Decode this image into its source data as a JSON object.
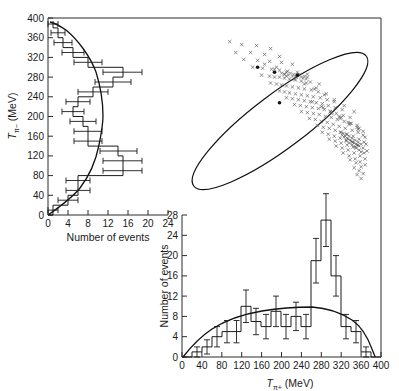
{
  "figure": {
    "caption": "",
    "background": "#ffffff",
    "ink_color": "#1a1a1a"
  },
  "panels": {
    "left_histogram": {
      "name": "T-pi-minus histogram",
      "value_axis_label": "Number of events",
      "energy_axis_label": "Tπ− (MeV)",
      "energy_axis_label_main": "T",
      "energy_axis_label_sub": "π−",
      "energy_axis_label_unit": "(MeV)",
      "value_axis_ticks": [
        0,
        4,
        8,
        12,
        16,
        20,
        24
      ],
      "energy_axis_ticks": [
        0,
        40,
        80,
        120,
        160,
        200,
        240,
        280,
        320,
        360,
        400
      ]
    },
    "bottom_histogram": {
      "name": "T-pi-plus histogram",
      "value_axis_label": "Number of events",
      "energy_axis_label": "Tπ+ (MeV)",
      "energy_axis_label_main": "T",
      "energy_axis_label_sub": "π+",
      "energy_axis_label_unit": "(MeV)",
      "value_axis_ticks": [
        0,
        4,
        8,
        12,
        16,
        20,
        24,
        28
      ],
      "energy_axis_ticks": [
        0,
        40,
        80,
        120,
        160,
        200,
        240,
        280,
        320,
        360,
        400
      ]
    },
    "scatter": {
      "name": "Dalitz scatter plot",
      "boundary_shape": "ellipse",
      "marker": "cross"
    }
  },
  "chart_data": [
    {
      "type": "bar",
      "orientation": "horizontal",
      "title": "",
      "xlabel": "Number of events",
      "ylabel": "Tπ− (MeV)",
      "xlim": [
        0,
        24
      ],
      "ylim": [
        0,
        400
      ],
      "bin_width": 20,
      "grid": false,
      "bin_centers": [
        10,
        30,
        50,
        70,
        90,
        110,
        130,
        150,
        170,
        190,
        210,
        230,
        250,
        270,
        290,
        310,
        330,
        350,
        370,
        390
      ],
      "values": [
        1,
        4,
        6,
        6,
        15,
        15,
        14,
        8,
        8,
        7,
        5,
        6,
        9,
        13,
        15,
        8,
        5,
        3,
        2,
        1
      ],
      "errors": [
        1,
        2,
        2.4,
        2.4,
        3.9,
        3.9,
        3.7,
        2.8,
        2.8,
        2.6,
        2.2,
        2.4,
        3,
        3.6,
        3.9,
        2.8,
        2.2,
        1.7,
        1.4,
        1
      ],
      "overlay_curve": {
        "name": "phase-space prediction",
        "peak_value": 10,
        "x_at_peak": 200,
        "endpoints": [
          0,
          380
        ]
      }
    },
    {
      "type": "bar",
      "orientation": "vertical",
      "title": "",
      "xlabel": "Tπ+ (MeV)",
      "ylabel": "Number of events",
      "xlim": [
        0,
        400
      ],
      "ylim": [
        0,
        28
      ],
      "bin_width": 20,
      "grid": false,
      "bin_centers": [
        10,
        30,
        50,
        70,
        90,
        110,
        130,
        150,
        170,
        190,
        210,
        230,
        250,
        270,
        290,
        310,
        330,
        350,
        370,
        390
      ],
      "values": [
        0,
        1,
        2,
        4,
        5,
        5,
        10,
        7,
        6,
        9,
        6,
        8,
        6,
        19,
        27,
        16,
        6,
        5,
        1,
        0
      ],
      "errors": [
        0,
        1,
        1.4,
        2,
        2.2,
        2.2,
        3.2,
        2.6,
        2.4,
        3,
        2.4,
        2.8,
        2.4,
        4.4,
        5.2,
        4,
        2.4,
        2.2,
        1,
        0
      ],
      "overlay_curve": {
        "name": "phase-space prediction",
        "peak_value": 10,
        "x_at_peak": 200,
        "endpoints": [
          0,
          380
        ]
      }
    },
    {
      "type": "scatter",
      "title": "",
      "xlabel": "Tπ+ (MeV)",
      "ylabel": "Tπ− (MeV)",
      "xlim": [
        0,
        400
      ],
      "ylim": [
        0,
        400
      ],
      "grid": false,
      "marker": "x",
      "boundary": {
        "type": "ellipse",
        "center_x": 200,
        "center_y": 200,
        "semi_major": 250,
        "semi_minor": 42,
        "rotation_deg": -45
      },
      "n_points": 168,
      "points": [
        [
          96,
          352
        ],
        [
          120,
          346
        ],
        [
          150,
          344
        ],
        [
          178,
          338
        ],
        [
          108,
          330
        ],
        [
          138,
          330
        ],
        [
          166,
          326
        ],
        [
          196,
          322
        ],
        [
          124,
          316
        ],
        [
          152,
          314
        ],
        [
          176,
          312
        ],
        [
          200,
          310
        ],
        [
          222,
          306
        ],
        [
          142,
          300
        ],
        [
          162,
          298
        ],
        [
          180,
          296
        ],
        [
          196,
          294
        ],
        [
          212,
          292
        ],
        [
          232,
          290
        ],
        [
          252,
          286
        ],
        [
          160,
          284
        ],
        [
          176,
          282
        ],
        [
          186,
          280
        ],
        [
          196,
          280
        ],
        [
          206,
          278
        ],
        [
          216,
          276
        ],
        [
          228,
          274
        ],
        [
          240,
          272
        ],
        [
          258,
          270
        ],
        [
          276,
          266
        ],
        [
          178,
          268
        ],
        [
          190,
          266
        ],
        [
          200,
          264
        ],
        [
          210,
          262
        ],
        [
          222,
          260
        ],
        [
          234,
          258
        ],
        [
          246,
          256
        ],
        [
          260,
          254
        ],
        [
          274,
          250
        ],
        [
          290,
          246
        ],
        [
          196,
          252
        ],
        [
          206,
          250
        ],
        [
          216,
          248
        ],
        [
          228,
          246
        ],
        [
          240,
          244
        ],
        [
          252,
          242
        ],
        [
          264,
          240
        ],
        [
          278,
          238
        ],
        [
          292,
          234
        ],
        [
          306,
          230
        ],
        [
          210,
          238
        ],
        [
          222,
          236
        ],
        [
          234,
          234
        ],
        [
          246,
          232
        ],
        [
          258,
          230
        ],
        [
          270,
          228
        ],
        [
          282,
          226
        ],
        [
          294,
          222
        ],
        [
          308,
          218
        ],
        [
          322,
          214
        ],
        [
          226,
          224
        ],
        [
          238,
          222
        ],
        [
          250,
          220
        ],
        [
          262,
          218
        ],
        [
          274,
          216
        ],
        [
          286,
          214
        ],
        [
          298,
          210
        ],
        [
          310,
          206
        ],
        [
          324,
          202
        ],
        [
          338,
          198
        ],
        [
          240,
          210
        ],
        [
          252,
          208
        ],
        [
          264,
          206
        ],
        [
          276,
          204
        ],
        [
          288,
          200
        ],
        [
          300,
          198
        ],
        [
          312,
          194
        ],
        [
          326,
          190
        ],
        [
          340,
          186
        ],
        [
          352,
          182
        ],
        [
          256,
          196
        ],
        [
          268,
          194
        ],
        [
          280,
          190
        ],
        [
          292,
          188
        ],
        [
          304,
          184
        ],
        [
          316,
          180
        ],
        [
          328,
          176
        ],
        [
          342,
          172
        ],
        [
          354,
          168
        ],
        [
          364,
          162
        ],
        [
          272,
          182
        ],
        [
          284,
          178
        ],
        [
          296,
          176
        ],
        [
          308,
          172
        ],
        [
          320,
          168
        ],
        [
          332,
          164
        ],
        [
          344,
          160
        ],
        [
          356,
          154
        ],
        [
          366,
          148
        ],
        [
          282,
          168
        ],
        [
          294,
          164
        ],
        [
          306,
          160
        ],
        [
          318,
          156
        ],
        [
          330,
          152
        ],
        [
          342,
          148
        ],
        [
          354,
          142
        ],
        [
          364,
          136
        ],
        [
          296,
          154
        ],
        [
          308,
          150
        ],
        [
          320,
          146
        ],
        [
          332,
          142
        ],
        [
          344,
          138
        ],
        [
          356,
          132
        ],
        [
          366,
          126
        ],
        [
          310,
          140
        ],
        [
          322,
          136
        ],
        [
          334,
          132
        ],
        [
          346,
          126
        ],
        [
          358,
          120
        ],
        [
          368,
          114
        ],
        [
          324,
          126
        ],
        [
          336,
          120
        ],
        [
          348,
          114
        ],
        [
          358,
          108
        ],
        [
          368,
          102
        ],
        [
          338,
          112
        ],
        [
          350,
          106
        ],
        [
          360,
          98
        ],
        [
          346,
          96
        ],
        [
          356,
          90
        ],
        [
          364,
          84
        ],
        [
          352,
          82
        ],
        [
          360,
          74
        ],
        [
          190,
          300
        ],
        [
          210,
          290
        ],
        [
          230,
          280
        ],
        [
          250,
          268
        ],
        [
          270,
          258
        ],
        [
          166,
          306
        ],
        [
          186,
          296
        ],
        [
          206,
          286
        ],
        [
          226,
          276
        ],
        [
          246,
          266
        ],
        [
          266,
          256
        ],
        [
          286,
          244
        ],
        [
          306,
          234
        ],
        [
          326,
          222
        ],
        [
          346,
          210
        ],
        [
          300,
          206
        ],
        [
          318,
          196
        ],
        [
          336,
          184
        ],
        [
          354,
          174
        ],
        [
          284,
          218
        ],
        [
          302,
          208
        ],
        [
          320,
          198
        ],
        [
          338,
          186
        ],
        [
          356,
          176
        ],
        [
          262,
          230
        ],
        [
          280,
          220
        ],
        [
          298,
          210
        ],
        [
          316,
          200
        ],
        [
          334,
          188
        ],
        [
          352,
          178
        ],
        [
          364,
          170
        ],
        [
          368,
          158
        ],
        [
          370,
          144
        ],
        [
          372,
          130
        ],
        [
          360,
          128
        ],
        [
          350,
          136
        ]
      ],
      "dense_points": [
        [
          218,
          288
        ],
        [
          224,
          286
        ],
        [
          230,
          284
        ],
        [
          236,
          286
        ],
        [
          222,
          282
        ],
        [
          228,
          280
        ],
        [
          234,
          282
        ],
        [
          240,
          280
        ],
        [
          214,
          284
        ],
        [
          210,
          282
        ],
        [
          206,
          286
        ],
        [
          200,
          288
        ],
        [
          244,
          278
        ],
        [
          250,
          276
        ],
        [
          246,
          282
        ],
        [
          252,
          280
        ],
        [
          330,
          150
        ],
        [
          336,
          146
        ],
        [
          342,
          142
        ],
        [
          348,
          138
        ],
        [
          334,
          154
        ],
        [
          340,
          150
        ],
        [
          346,
          146
        ],
        [
          352,
          142
        ],
        [
          326,
          158
        ],
        [
          332,
          156
        ],
        [
          338,
          152
        ],
        [
          344,
          148
        ],
        [
          350,
          144
        ],
        [
          356,
          140
        ],
        [
          322,
          162
        ],
        [
          328,
          160
        ],
        [
          318,
          168
        ],
        [
          324,
          166
        ],
        [
          330,
          164
        ],
        [
          336,
          160
        ],
        [
          342,
          156
        ],
        [
          348,
          152
        ],
        [
          354,
          148
        ],
        [
          360,
          144
        ]
      ],
      "heavy_points": [
        [
          152,
          300
        ],
        [
          232,
          284
        ],
        [
          196,
          228
        ],
        [
          186,
          290
        ]
      ]
    }
  ]
}
